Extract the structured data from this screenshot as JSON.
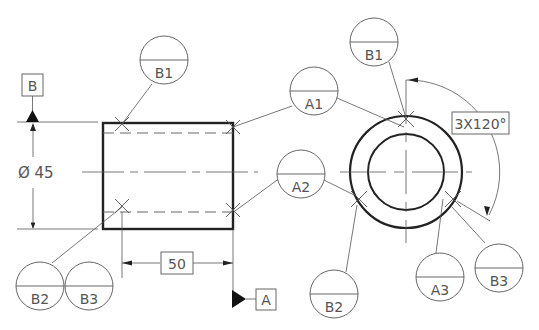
{
  "diagram": {
    "type": "gd&t-datum-targets",
    "datums": {
      "B": "B",
      "A": "A"
    },
    "dimensions": {
      "diameter": "Ø 45",
      "length": "50",
      "angular": "3X120°"
    },
    "balloons": {
      "b1_left": {
        "letter": "B1"
      },
      "a1": {
        "letter": "A1"
      },
      "a2": {
        "letter": "A2"
      },
      "b2_left": {
        "letter": "B2"
      },
      "b3_left": {
        "letter": "B3"
      },
      "b1_right": {
        "letter": "B1"
      },
      "b2_right": {
        "letter": "B2"
      },
      "a3": {
        "letter": "A3"
      },
      "b3_right": {
        "letter": "B3"
      }
    },
    "colors": {
      "line": "#444444",
      "thick": "#222222",
      "text": "#555555"
    }
  }
}
